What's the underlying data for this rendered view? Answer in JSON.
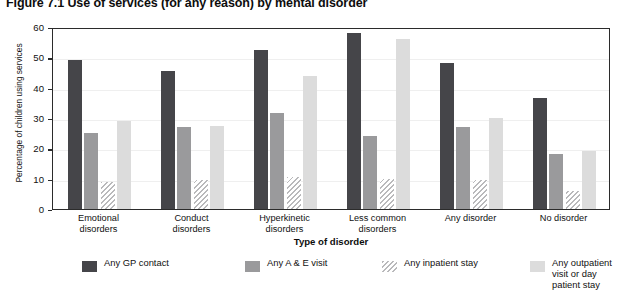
{
  "title": "Figure 7.1  Use of services (for any reason) by mental disorder",
  "axes": {
    "y_title": "Percentage of children using services",
    "x_title": "Type of disorder",
    "y_ticks": [
      "0",
      "10",
      "20",
      "30",
      "40",
      "50",
      "60"
    ]
  },
  "legend": {
    "items": [
      {
        "key": "gp",
        "label": "Any GP contact",
        "color": "#454549"
      },
      {
        "key": "ae",
        "label": "Any A & E visit",
        "color": "#9a9a9c"
      },
      {
        "key": "inpat",
        "label": "Any inpatient stay",
        "color": "#b9b9bb"
      },
      {
        "key": "outpat",
        "label": "Any outpatient\nvisit or day patient stay",
        "color": "#dcdcdc"
      }
    ]
  },
  "chart_data": {
    "type": "bar",
    "title": "Figure 7.1  Use of services (for any reason) by mental disorder",
    "xlabel": "Type of disorder",
    "ylabel": "Percentage of children using services",
    "ylim": [
      0,
      60
    ],
    "ytick_step": 10,
    "grid": false,
    "legend_position": "bottom",
    "categories": [
      "Emotional\ndisorders",
      "Conduct\ndisorders",
      "Hyperkinetic\ndisorders",
      "Less common\ndisorders",
      "Any disorder",
      "No disorder"
    ],
    "series": [
      {
        "name": "Any GP contact",
        "values": [
          49,
          45.5,
          52.5,
          58,
          48,
          36.5
        ]
      },
      {
        "name": "Any A & E visit",
        "values": [
          25,
          27,
          31.5,
          24,
          27,
          18
        ]
      },
      {
        "name": "Any inpatient stay",
        "values": [
          9,
          9.5,
          10.5,
          10,
          9.5,
          6
        ]
      },
      {
        "name": "Any outpatient visit or day patient stay",
        "values": [
          29,
          27.5,
          44,
          56,
          30,
          19
        ]
      }
    ]
  }
}
